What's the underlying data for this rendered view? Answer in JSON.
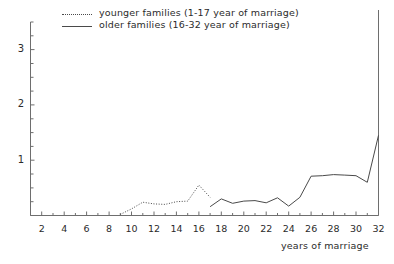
{
  "chart_data": {
    "type": "line",
    "title": "",
    "subtitle": "",
    "xlabel": "years of marriage",
    "ylabel": "",
    "xlim": [
      1,
      32
    ],
    "ylim": [
      0,
      3.5
    ],
    "grid": false,
    "legend_position": "top-left",
    "xticks": [
      2,
      4,
      6,
      8,
      10,
      12,
      14,
      16,
      18,
      20,
      22,
      24,
      26,
      28,
      30,
      32
    ],
    "xtick_labels": [
      "2",
      "4",
      "6",
      "8",
      "10",
      "12",
      "14",
      "16",
      "18",
      "20",
      "22",
      "24",
      "26",
      "28",
      "30",
      "32"
    ],
    "yticks": [
      1,
      2,
      3
    ],
    "ytick_labels": [
      "1",
      "2",
      "3"
    ],
    "yminor_tick_step": 0.25,
    "series": [
      {
        "name": "younger families (1-17 year of marriage)",
        "style": "dotted",
        "color": "#4a4a4a",
        "x": [
          9,
          10,
          11,
          12,
          13,
          14,
          15,
          16,
          17
        ],
        "values": [
          0.02,
          0.12,
          0.24,
          0.21,
          0.2,
          0.25,
          0.26,
          0.55,
          0.33
        ]
      },
      {
        "name": "older families (16-32 year of marriage)",
        "style": "solid",
        "color": "#4a4a4a",
        "x": [
          17,
          18,
          19,
          20,
          21,
          22,
          23,
          24,
          25,
          26,
          27,
          28,
          29,
          30,
          31,
          32
        ],
        "values": [
          0.16,
          0.3,
          0.22,
          0.26,
          0.27,
          0.23,
          0.32,
          0.17,
          0.33,
          0.71,
          0.72,
          0.74,
          0.73,
          0.72,
          0.6,
          1.45
        ]
      }
    ]
  },
  "legend": {
    "entries": [
      {
        "label": "younger families (1-17 year of marriage)",
        "style": "dotted"
      },
      {
        "label": "older families (16-32 year of marriage)",
        "style": "solid"
      }
    ]
  },
  "axes": {
    "x_title": "years of marriage"
  }
}
